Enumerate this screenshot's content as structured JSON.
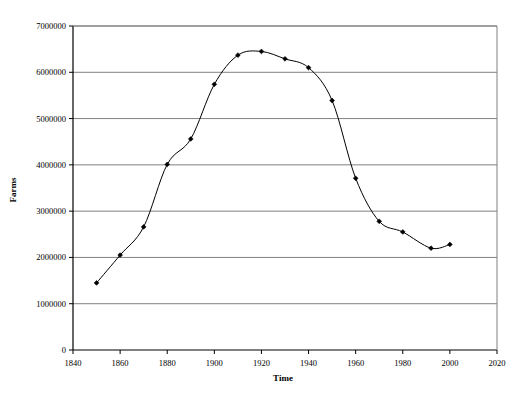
{
  "chart_data": {
    "type": "line",
    "title": "",
    "xlabel": "Time",
    "ylabel": "Farms",
    "xlim": [
      1840,
      2020
    ],
    "ylim": [
      0,
      7000000
    ],
    "grid": "horizontal",
    "legend": "none",
    "marker": "filled-diamond",
    "line_color": "#000000",
    "marker_color": "#000000",
    "grid_color": "#808080",
    "axis_color": "#000000",
    "background_color": "#ffffff",
    "xticks": [
      1840,
      1860,
      1880,
      1900,
      1920,
      1940,
      1960,
      1980,
      2000,
      2020
    ],
    "xtick_labels": [
      "1840",
      "1860",
      "1880",
      "1900",
      "1920",
      "1940",
      "1960",
      "1980",
      "2000",
      "2020"
    ],
    "yticks": [
      0,
      1000000,
      2000000,
      3000000,
      4000000,
      5000000,
      6000000,
      7000000
    ],
    "ytick_labels": [
      "0",
      "1000000",
      "2000000",
      "3000000",
      "4000000",
      "5000000",
      "6000000",
      "7000000"
    ],
    "x": [
      1850,
      1860,
      1870,
      1880,
      1890,
      1900,
      1910,
      1920,
      1930,
      1940,
      1950,
      1960,
      1970,
      1980,
      1992,
      2000
    ],
    "values": [
      1450000,
      2050000,
      2660000,
      4010000,
      4560000,
      5740000,
      6370000,
      6450000,
      6290000,
      6100000,
      5390000,
      3710000,
      2780000,
      2550000,
      2200000,
      2280000
    ],
    "series": [
      {
        "name": "Farms",
        "x": [
          1850,
          1860,
          1870,
          1880,
          1890,
          1900,
          1910,
          1920,
          1930,
          1940,
          1950,
          1960,
          1970,
          1980,
          1992,
          2000
        ],
        "values": [
          1450000,
          2050000,
          2660000,
          4010000,
          4560000,
          5740000,
          6370000,
          6450000,
          6290000,
          6100000,
          5390000,
          3710000,
          2780000,
          2550000,
          2200000,
          2280000
        ]
      }
    ]
  },
  "axes": {
    "x_title": "Time",
    "y_title": "Farms"
  }
}
